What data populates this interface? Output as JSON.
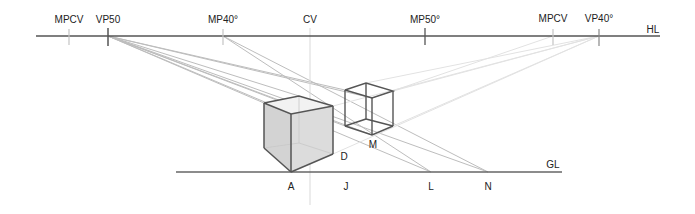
{
  "horizon_line": {
    "label": "HL",
    "markers": [
      {
        "id": "mpcv-left",
        "label": "MPCV",
        "x": 69
      },
      {
        "id": "vp50",
        "label": "VP50",
        "x": 108
      },
      {
        "id": "mp40",
        "label": "MP40°",
        "x": 223
      },
      {
        "id": "cv",
        "label": "CV",
        "x": 310
      },
      {
        "id": "mp50",
        "label": "MP50°",
        "x": 425
      },
      {
        "id": "mpcv-right",
        "label": "MPCV",
        "x": 553
      },
      {
        "id": "vp40",
        "label": "VP40°",
        "x": 599
      }
    ]
  },
  "ground_line": {
    "label": "GL",
    "points": [
      {
        "id": "a",
        "label": "A",
        "x": 291
      },
      {
        "id": "j",
        "label": "J",
        "x": 346
      },
      {
        "id": "l",
        "label": "L",
        "x": 431
      },
      {
        "id": "n",
        "label": "N",
        "x": 488
      }
    ]
  },
  "cube_labels": {
    "d": "D",
    "m": "M"
  },
  "colors": {
    "line": "#444444",
    "construction": "#b5b5b5",
    "construction_light": "#e2e2e2",
    "cube_fill": "#d8d8d8"
  }
}
